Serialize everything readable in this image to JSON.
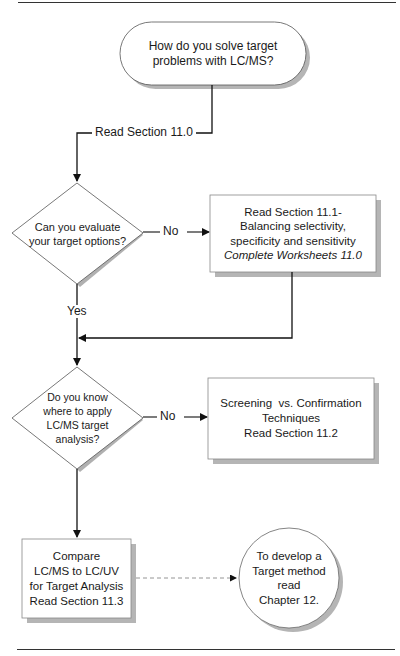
{
  "page": {
    "top_rule": true,
    "bottom_rule": true
  },
  "flowchart": {
    "start": {
      "type": "terminator",
      "lines": [
        "How do you solve target",
        "problems with LC/MS?"
      ]
    },
    "edge_start_to_decision1": {
      "label": "Read Section 11.0"
    },
    "decision1": {
      "type": "decision",
      "lines": [
        "Can you evaluate",
        "your target options?"
      ],
      "no_label": "No",
      "yes_label": "Yes"
    },
    "process1": {
      "type": "process",
      "lines": [
        "Read Section 11.1-",
        "Balancing selectivity,",
        "specificity and sensitivity"
      ],
      "italic_line": "Complete Worksheets 11.0"
    },
    "decision2": {
      "type": "decision",
      "lines": [
        "Do you know",
        "where to apply",
        "LC/MS target",
        "analysis?"
      ],
      "no_label": "No"
    },
    "process2": {
      "type": "process",
      "lines": [
        "Screening  vs. Confirmation",
        "Techniques",
        "Read Section 11.2"
      ]
    },
    "process3": {
      "type": "process",
      "lines": [
        "Compare",
        "LC/MS to LC/UV",
        "for Target Analysis",
        "Read Section 11.3"
      ]
    },
    "connector_end": {
      "type": "connector-circle",
      "lines": [
        "To develop a",
        "Target method",
        "read",
        "Chapter 12."
      ]
    },
    "colors": {
      "stroke": "#333333",
      "shadow": "#b5b5b5",
      "fill": "#ffffff"
    }
  }
}
